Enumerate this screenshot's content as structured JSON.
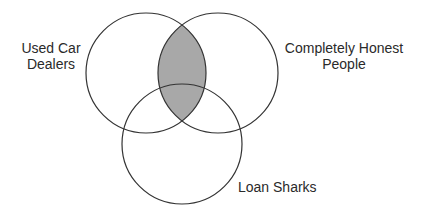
{
  "diagram": {
    "type": "venn",
    "sets": [
      {
        "name": "used-car-dealers",
        "label_lines": [
          "Used Car",
          "Dealers"
        ],
        "cx": 146,
        "cy": 73,
        "r": 60
      },
      {
        "name": "completely-honest-people",
        "label_lines": [
          "Completely Honest",
          "People"
        ],
        "cx": 218,
        "cy": 73,
        "r": 60
      },
      {
        "name": "loan-sharks",
        "label_lines": [
          "Loan Sharks"
        ],
        "cx": 182,
        "cy": 144,
        "r": 60
      }
    ],
    "highlighted_region": "Used Car Dealers ∩ Completely Honest People",
    "colors": {
      "stroke": "#333333",
      "highlight_fill": "#a8a8a8",
      "background": "#ffffff"
    }
  }
}
